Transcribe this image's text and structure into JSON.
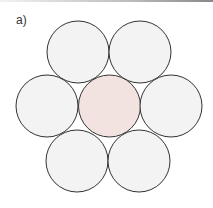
{
  "figure": {
    "label": "a)",
    "outer_fill": "#f3f3f3",
    "center_fill": "#f3e3e0",
    "stroke": "#333333",
    "radius": 31,
    "circles": [
      {
        "name": "circle-top-left",
        "cx": 78,
        "cy": 52,
        "role": "outer"
      },
      {
        "name": "circle-top-right",
        "cx": 140,
        "cy": 52,
        "role": "outer"
      },
      {
        "name": "circle-left",
        "cx": 47,
        "cy": 106,
        "role": "outer"
      },
      {
        "name": "circle-center",
        "cx": 109.5,
        "cy": 106,
        "role": "center"
      },
      {
        "name": "circle-right",
        "cx": 171,
        "cy": 106,
        "role": "outer"
      },
      {
        "name": "circle-bottom-left",
        "cx": 77,
        "cy": 161,
        "role": "outer"
      },
      {
        "name": "circle-bottom-right",
        "cx": 139,
        "cy": 161,
        "role": "outer"
      }
    ]
  }
}
